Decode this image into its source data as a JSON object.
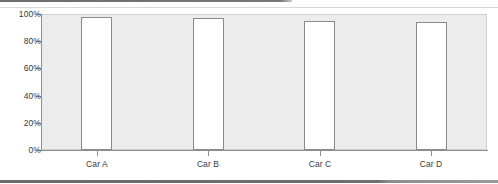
{
  "chart_data": {
    "type": "bar",
    "title": "",
    "subtitle": "",
    "xlabel": "",
    "ylabel": "",
    "categories": [
      "Car A",
      "Car B",
      "Car C",
      "Car D"
    ],
    "values": [
      98,
      97,
      95,
      94
    ],
    "ylim": [
      0,
      100
    ],
    "y_tick_labels": [
      "0%",
      "20%",
      "40%",
      "60%",
      "80%",
      "100%"
    ],
    "y_tick_values": [
      0,
      20,
      40,
      60,
      80,
      100
    ],
    "grid": false,
    "legend": null,
    "legend_position": "none",
    "bar_fill_color": "#ffffff",
    "bar_edge_color": "#8a8a8a",
    "plot_background_color": "#ececec",
    "axis_color": "#8f8f8f",
    "tick_label_color": "#3a3a3a",
    "annotations": []
  }
}
